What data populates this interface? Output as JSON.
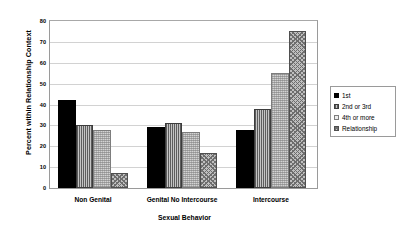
{
  "chart_data": {
    "type": "bar",
    "title": "",
    "xlabel": "Sexual Behavior",
    "ylabel": "Percent within Relationship Context",
    "categories": [
      "Non Genital",
      "Genital No Intercourse",
      "Intercourse"
    ],
    "series": [
      {
        "name": "1st",
        "values": [
          42,
          29,
          28
        ]
      },
      {
        "name": "2nd or 3rd",
        "values": [
          30,
          31,
          38
        ]
      },
      {
        "name": "4th or more",
        "values": [
          28,
          27,
          55
        ]
      },
      {
        "name": "Relationship",
        "values": [
          7,
          17,
          75
        ]
      }
    ],
    "ylim": [
      0,
      80
    ],
    "yticks": [
      0,
      10,
      20,
      30,
      40,
      50,
      60,
      70,
      80
    ],
    "grid": true,
    "legend_position": "right"
  },
  "legend": {
    "items": [
      {
        "label": "1st"
      },
      {
        "label": "2nd or 3rd"
      },
      {
        "label": "4th or more"
      },
      {
        "label": "Relationship"
      }
    ]
  }
}
